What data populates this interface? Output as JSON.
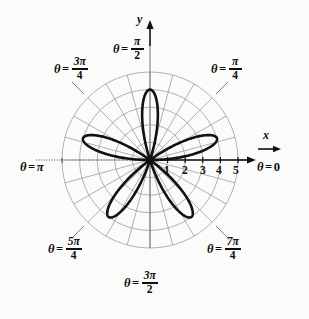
{
  "figure": {
    "title": "",
    "background": "#fbfbf9",
    "curve_color": "#111111",
    "grid_color": "#9a9a9a",
    "axis_color": "#111111"
  },
  "axes": {
    "x_label": "x",
    "y_label": "y",
    "x_tick_labels": [
      "1",
      "2",
      "3",
      "4",
      "5"
    ],
    "x_tick_values": [
      1,
      2,
      3,
      4,
      5
    ]
  },
  "angle_labels": [
    {
      "name": "theta-0",
      "theta_symbol": "θ",
      "equals": "=",
      "value": "0",
      "numerator": "",
      "denominator": "",
      "is_fraction": false
    },
    {
      "name": "theta-pi-4",
      "theta_symbol": "θ",
      "equals": "=",
      "value": "",
      "numerator": "π",
      "denominator": "4",
      "is_fraction": true
    },
    {
      "name": "theta-pi-2",
      "theta_symbol": "θ",
      "equals": "=",
      "value": "",
      "numerator": "π",
      "denominator": "2",
      "is_fraction": true
    },
    {
      "name": "theta-3pi-4",
      "theta_symbol": "θ",
      "equals": "=",
      "value": "",
      "numerator": "3π",
      "denominator": "4",
      "is_fraction": true
    },
    {
      "name": "theta-pi",
      "theta_symbol": "θ",
      "equals": "=",
      "value": "π",
      "numerator": "",
      "denominator": "",
      "is_fraction": false
    },
    {
      "name": "theta-5pi-4",
      "theta_symbol": "θ",
      "equals": "=",
      "value": "",
      "numerator": "5π",
      "denominator": "4",
      "is_fraction": true
    },
    {
      "name": "theta-3pi-2",
      "theta_symbol": "θ",
      "equals": "=",
      "value": "",
      "numerator": "3π",
      "denominator": "2",
      "is_fraction": true
    },
    {
      "name": "theta-7pi-4",
      "theta_symbol": "θ",
      "equals": "=",
      "value": "",
      "numerator": "7π",
      "denominator": "4",
      "is_fraction": true
    }
  ],
  "chart_data": {
    "type": "line",
    "plot_kind": "polar",
    "title": "",
    "xlabel": "x",
    "ylabel": "y",
    "curve_name": "five-petaled rose",
    "equation": "r = 4 sin(5θ)",
    "petal_count": 5,
    "max_radius": 4,
    "r_ticks": [
      1,
      2,
      3,
      4,
      5
    ],
    "r_limit": [
      0,
      5.6
    ],
    "grid": true,
    "grid_circles": [
      1,
      2,
      3,
      4,
      5
    ],
    "grid_radial_step_deg": 15,
    "legend": "none",
    "petal_tip_angles_deg": [
      90,
      162,
      234,
      306,
      18
    ],
    "petals": [
      {
        "tip_theta_deg": 90,
        "tip_r": 4
      },
      {
        "tip_theta_deg": 162,
        "tip_r": 4
      },
      {
        "tip_theta_deg": 234,
        "tip_r": 4
      },
      {
        "tip_theta_deg": 306,
        "tip_r": 4
      },
      {
        "tip_theta_deg": 18,
        "tip_r": 4
      }
    ],
    "axis_tick_labels": [
      "1",
      "2",
      "3",
      "4",
      "5"
    ],
    "angle_gridline_labels": [
      "θ = 0",
      "θ = π/4",
      "θ = π/2",
      "θ = 3π/4",
      "θ = π",
      "θ = 5π/4",
      "θ = 3π/2",
      "θ = 7π/4"
    ]
  }
}
